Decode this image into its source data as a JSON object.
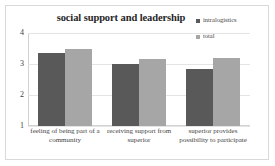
{
  "chart_data": {
    "type": "bar",
    "title": "social support and leadership",
    "xlabel": "",
    "ylabel": "",
    "ylim": [
      1,
      4
    ],
    "yticks": [
      4,
      3,
      2,
      1
    ],
    "grid": true,
    "legend_position": "top-right",
    "categories": [
      "feeling of being part of a community",
      "receiving support from superior",
      "superior provides possibility to participate"
    ],
    "series": [
      {
        "name": "intralogistics",
        "color": "#595959",
        "values": [
          3.35,
          3.0,
          2.85
        ]
      },
      {
        "name": "total",
        "color": "#a6a6a6",
        "values": [
          3.5,
          3.15,
          3.2
        ]
      }
    ]
  },
  "legend": {
    "marker_icon": "square-marker-icon"
  },
  "frame": {
    "border_color": "#d9d9d9",
    "background": "#ffffff"
  }
}
